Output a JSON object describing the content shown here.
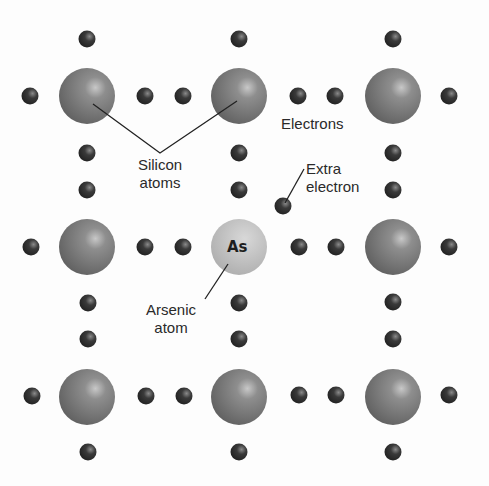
{
  "diagram": {
    "labels": {
      "silicon_atoms": [
        "Silicon",
        "atoms"
      ],
      "electrons": "Electrons",
      "extra_electron": [
        "Extra",
        "electron"
      ],
      "arsenic_atom": [
        "Arsenic",
        "atom"
      ],
      "arsenic_symbol": "As"
    },
    "atoms": [
      {
        "type": "Si",
        "x": 87,
        "y": 96
      },
      {
        "type": "Si",
        "x": 239,
        "y": 96
      },
      {
        "type": "Si",
        "x": 393,
        "y": 96
      },
      {
        "type": "Si",
        "x": 87,
        "y": 247
      },
      {
        "type": "As",
        "x": 239,
        "y": 247
      },
      {
        "type": "Si",
        "x": 393,
        "y": 247
      },
      {
        "type": "Si",
        "x": 87,
        "y": 397
      },
      {
        "type": "Si",
        "x": 239,
        "y": 397
      },
      {
        "type": "Si",
        "x": 393,
        "y": 397
      }
    ],
    "colors": {
      "silicon": "#7a7a7a",
      "arsenic": "#b8b8b8",
      "electron": "#2e2e2e",
      "leader_line": "#222222",
      "text": "#2a2a2a"
    }
  }
}
